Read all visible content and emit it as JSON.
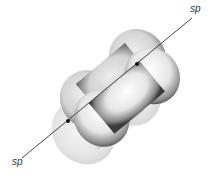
{
  "diagram": {
    "labels": {
      "top_right": "sp",
      "bottom_left": "sp"
    },
    "colors": {
      "background": "#ffffff",
      "front_lobe_dark": "#3a3a3a",
      "front_lobe_light": "#f2f2f2",
      "back_lobe": "#d8d8d8",
      "axis": "#333333",
      "nucleus": "#111111"
    }
  }
}
